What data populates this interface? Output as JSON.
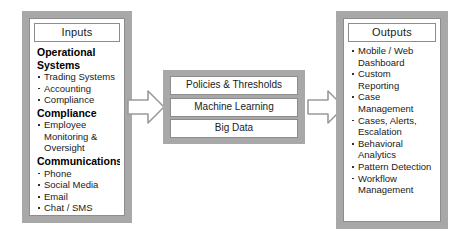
{
  "diagram": {
    "colors": {
      "panel_fill": "#a8a8a8",
      "box_fill": "#ffffff",
      "border": "#8d8d8d",
      "text": "#1a1a1a",
      "background": "#ffffff"
    }
  },
  "inputs": {
    "header": "Inputs",
    "groups": [
      {
        "title": "Operational Systems",
        "items": [
          "Trading Systems",
          "Accounting",
          "Compliance"
        ]
      },
      {
        "title": "Compliance",
        "items": [
          "Employee Monitoring & Oversight"
        ]
      },
      {
        "title": "Communications",
        "items": [
          "Phone",
          "Social Media",
          "Email",
          "Chat / SMS"
        ]
      }
    ]
  },
  "engine": {
    "boxes": [
      "Policies & Thresholds",
      "Machine Learning",
      "Big Data"
    ]
  },
  "outputs": {
    "header": "Outputs",
    "items": [
      "Mobile / Web Dashboard",
      "Custom Reporting",
      "Case Management",
      "Cases, Alerts, Escalation",
      "Behavioral Analytics",
      "Pattern Detection",
      "Workflow Management"
    ]
  },
  "arrows": [
    {
      "name": "inputs-to-engine",
      "direction": "right"
    },
    {
      "name": "engine-to-outputs",
      "direction": "right"
    }
  ]
}
